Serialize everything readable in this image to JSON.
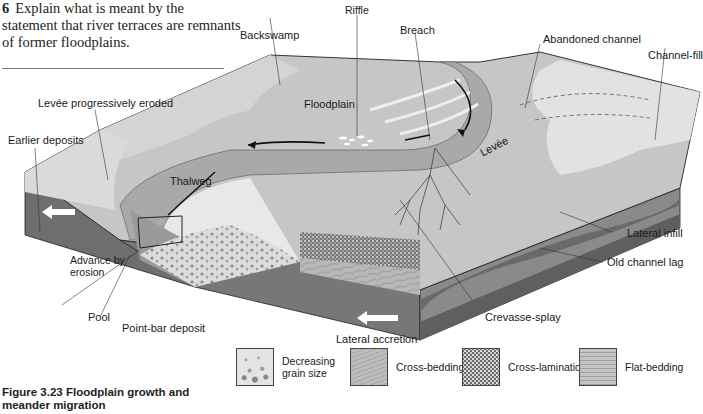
{
  "question": {
    "number": "6",
    "text": "Explain what is meant by the statement that river terraces are remnants of former floodplains."
  },
  "diagram": {
    "labels": {
      "backswamp": "Backswamp",
      "riffle": "Riffle",
      "breach": "Breach",
      "abandoned_channel": "Abandoned channel",
      "channel_fill": "Channel-fill",
      "floodplain": "Floodplain",
      "levee_eroded": "Levée progressively eroded",
      "earlier_deposits": "Earlier deposits",
      "levee": "Levée",
      "thalweg": "Thalweg",
      "lateral_infill": "Lateral infill",
      "old_channel_lag": "Old channel lag",
      "advance_by_erosion": "Advance by erosion",
      "pool": "Pool",
      "point_bar_deposit": "Point-bar deposit",
      "crevasse_splay": "Crevasse-splay",
      "lateral_accretion": "Lateral accretion"
    },
    "colors": {
      "surface_light": "#e6e6e6",
      "surface_mid": "#c8c8c8",
      "floodplain": "#b4b4b4",
      "channel": "#a8a8a8",
      "block_side_dark": "#6a6a6a",
      "block_side_mid": "#8c8c8c",
      "arrow": "#ffffff",
      "outline": "#222222"
    }
  },
  "legend": [
    {
      "key": "grain",
      "label_line1": "Decreasing",
      "label_line2": "grain size"
    },
    {
      "key": "cross_bedding",
      "label_line1": "Cross-bedding",
      "label_line2": ""
    },
    {
      "key": "cross_lamination",
      "label_line1": "Cross-lamination",
      "label_line2": ""
    },
    {
      "key": "flat_bedding",
      "label_line1": "Flat-bedding",
      "label_line2": ""
    }
  ],
  "caption": {
    "label": "Figure 3.23",
    "text": "Floodplain growth and meander migration"
  }
}
